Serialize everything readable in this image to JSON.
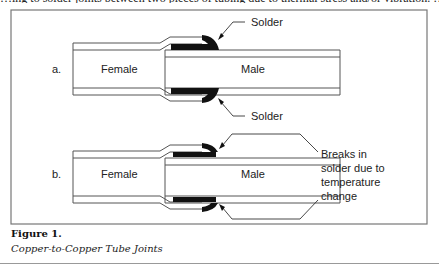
{
  "top_partial_text": "…ing to solder joints between two pieces of tubing due to thermal stress and/or vibration. …",
  "figure": {
    "a": {
      "label": "a.",
      "female_label": "Female",
      "male_label": "Male",
      "solder_top_label": "Solder",
      "solder_bottom_label": "Solder"
    },
    "b": {
      "label": "b.",
      "female_label": "Female",
      "male_label": "Male",
      "annotation_lines": [
        "Breaks in",
        "solder due to",
        "temperature",
        "change"
      ]
    }
  },
  "caption": {
    "title": "Figure 1.",
    "subtitle": "Copper-to-Copper Tube Joints"
  },
  "colors": {
    "line": "#555555",
    "solder": "#111111",
    "frame": "#777777"
  }
}
